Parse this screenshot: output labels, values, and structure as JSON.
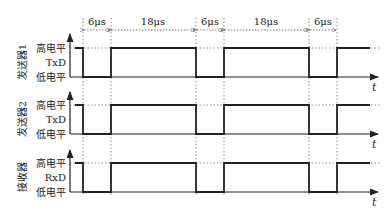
{
  "diagram": {
    "title": "",
    "dimensions": [
      {
        "label": "6μs",
        "x1": 83,
        "x2": 111
      },
      {
        "label": "18μs",
        "x1": 111,
        "x2": 196
      },
      {
        "label": "6μs",
        "x1": 196,
        "x2": 224
      },
      {
        "label": "18μs",
        "x1": 224,
        "x2": 309
      },
      {
        "label": "6μs",
        "x1": 309,
        "x2": 337
      }
    ],
    "time_axis_label": "t",
    "level_labels": {
      "high": "高电平",
      "low": "低电平"
    },
    "channels": [
      {
        "name": "发送器1",
        "signal": "TxD",
        "y_high": 48,
        "y_low": 77
      },
      {
        "name": "发送器2",
        "signal": "TxD",
        "y_high": 105,
        "y_low": 134
      },
      {
        "name": "接收器",
        "signal": "RxD",
        "y_high": 163,
        "y_low": 192
      }
    ],
    "waveform_edges_x": [
      83,
      111,
      196,
      224,
      309,
      337
    ],
    "waveform_start_x": 75,
    "waveform_end_x": 370,
    "axis_x": 70,
    "axis_end_x": 378,
    "colors": {
      "line": "#222222",
      "dotted": "#777777",
      "background": "#ffffff"
    }
  }
}
